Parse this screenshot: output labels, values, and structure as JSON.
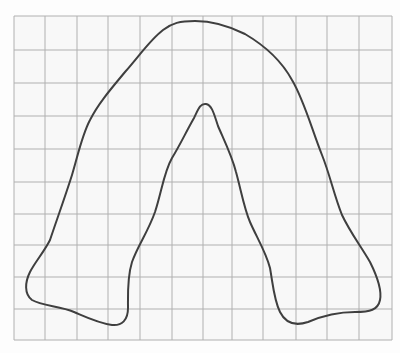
{
  "figure": {
    "colors": {
      "paper": "#f8f8f8",
      "grid_line": "#b0b0b0",
      "outline": "#3f3f3f"
    },
    "grid": {
      "x_lines": [
        14,
        45,
        77,
        108,
        140,
        172,
        203,
        232,
        263,
        296,
        327,
        359,
        392
      ],
      "y_lines": [
        16,
        50,
        83,
        116,
        149,
        182,
        214,
        245,
        277,
        309,
        340
      ],
      "columns": 12,
      "rows": 10
    },
    "outline_path": "M 50 240 C 56 222, 64 200, 72 175 C 78 155, 82 135, 90 120 C 98 104, 110 90, 125 72 C 140 55, 150 40, 163 30 C 172 23, 180 21, 195 21 C 210 21, 225 24, 245 34 C 262 44, 280 58, 292 80 C 304 100, 312 130, 322 155 C 330 175, 334 195, 342 215 C 350 232, 360 245, 370 262 C 378 278, 382 290, 380 300 C 378 310, 370 312, 355 312 C 340 312, 322 316, 308 322 C 296 326, 286 324, 280 312 C 274 300, 273 285, 270 268 C 266 252, 256 236, 250 222 C 244 208, 241 190, 236 172 C 232 156, 224 140, 218 126 C 214 114, 212 105, 206 104 C 200 103, 198 110, 194 118 C 186 132, 180 145, 172 158 C 164 172, 162 190, 155 212 C 148 232, 138 245, 132 262 C 127 278, 128 295, 128 308 C 128 320, 122 326, 112 325 C 98 323, 88 318, 74 312 C 60 306, 42 306, 32 300 C 24 294, 25 282, 30 272 C 35 262, 44 252, 50 240 Z"
  }
}
